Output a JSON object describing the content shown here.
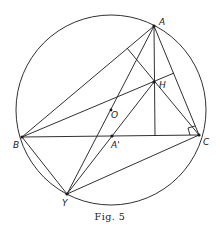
{
  "figure": {
    "caption": "Fig. 5",
    "stroke_color": "#1a1a1a",
    "background": "#ffffff"
  },
  "points": {
    "A": {
      "label": "A",
      "x": 154,
      "y": 26
    },
    "B": {
      "label": "B",
      "x": 22,
      "y": 137
    },
    "C": {
      "label": "C",
      "x": 199,
      "y": 135
    },
    "H": {
      "label": "H",
      "x": 154,
      "y": 82
    },
    "O": {
      "label": "O",
      "x": 111,
      "y": 110
    },
    "A_prime": {
      "label": "A'",
      "x": 112,
      "y": 136
    },
    "Y": {
      "label": "Y",
      "x": 67,
      "y": 194
    }
  },
  "circle": {
    "cx": 111,
    "cy": 110,
    "r": 95
  }
}
